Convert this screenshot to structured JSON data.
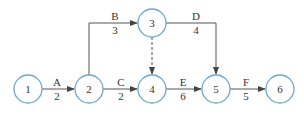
{
  "diagram": {
    "type": "activity-on-arrow network",
    "nodes": [
      {
        "id": "1",
        "label": "1"
      },
      {
        "id": "2",
        "label": "2"
      },
      {
        "id": "3",
        "label": "3"
      },
      {
        "id": "4",
        "label": "4"
      },
      {
        "id": "5",
        "label": "5"
      },
      {
        "id": "6",
        "label": "6"
      }
    ],
    "activities": [
      {
        "name": "A",
        "duration": "2",
        "from": "1",
        "to": "2"
      },
      {
        "name": "B",
        "duration": "3",
        "from": "2",
        "to": "3"
      },
      {
        "name": "C",
        "duration": "2",
        "from": "2",
        "to": "4"
      },
      {
        "name": "D",
        "duration": "4",
        "from": "3",
        "to": "5"
      },
      {
        "name": "E",
        "duration": "6",
        "from": "4",
        "to": "5"
      },
      {
        "name": "F",
        "duration": "5",
        "from": "5",
        "to": "6"
      }
    ],
    "dummy_activities": [
      {
        "from": "3",
        "to": "4",
        "style": "dashed"
      }
    ],
    "colors": {
      "node_stroke": "#6fa6cf",
      "edge": "#555555",
      "text": "#333333"
    }
  }
}
